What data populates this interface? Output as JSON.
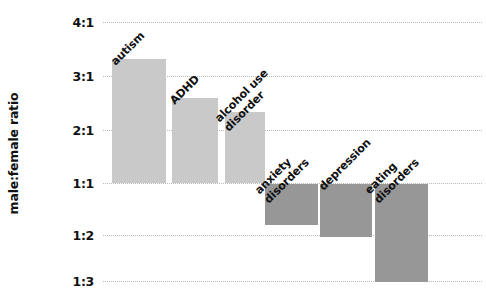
{
  "chart_data": {
    "type": "bar",
    "title": "",
    "subtitle": "",
    "xlabel": "",
    "ylabel": "male:female ratio",
    "categories": [
      "autism",
      "ADHD",
      "alcohol use\ndisorder",
      "anxiety\ndisorders",
      "depression",
      "eating\ndisorders"
    ],
    "values": [
      3.3,
      2.5,
      2.3,
      -1.8,
      -2.0,
      -3.0
    ],
    "value_labels": [
      "3.3:1",
      "2.5:1",
      "2.3:1",
      "1:1.8",
      "1:2",
      "1:3"
    ],
    "ytick_labels": [
      "4:1",
      "3:1",
      "2:1",
      "1:1",
      "1:2",
      "1:3"
    ],
    "ytick_values": [
      4,
      3,
      2,
      1,
      -2,
      -3
    ],
    "ylim": [
      -3.3,
      4.0
    ],
    "grid": true,
    "legend": "none",
    "baseline_label": "1:1",
    "colors": {
      "positive_bar": "#c9c9c9",
      "negative_bar": "#979797",
      "gridline": "#b9b9b9",
      "text": "#111111",
      "background": "#ffffff"
    }
  },
  "axis": {
    "ticks": [
      {
        "label": "4:1",
        "y": 22
      },
      {
        "label": "3:1",
        "y": 76
      },
      {
        "label": "2:1",
        "y": 130
      },
      {
        "label": "1:1",
        "y": 183
      },
      {
        "label": "1:2",
        "y": 235
      },
      {
        "label": "1:3",
        "y": 281
      }
    ]
  },
  "bars": [
    {
      "name": "autism",
      "label": "autism",
      "x": 112,
      "y": 59,
      "w": 54,
      "h": 124,
      "sign": "positive",
      "label_x": 118,
      "label_y": 56
    },
    {
      "name": "adhd",
      "label": "ADHD",
      "x": 172,
      "y": 98,
      "w": 46,
      "h": 85,
      "sign": "positive",
      "label_x": 177,
      "label_y": 95
    },
    {
      "name": "alcohol-use-disorder",
      "label": "alcohol use\ndisorder",
      "x": 225,
      "y": 112,
      "w": 40,
      "h": 71,
      "sign": "positive",
      "label_x": 231,
      "label_y": 109
    },
    {
      "name": "anxiety-disorders",
      "label": "anxiety\ndisorders",
      "x": 265,
      "y": 184,
      "w": 53,
      "h": 41,
      "sign": "negative",
      "label_x": 271,
      "label_y": 181
    },
    {
      "name": "depression",
      "label": "depression",
      "x": 320,
      "y": 184,
      "w": 52,
      "h": 53,
      "sign": "negative",
      "label_x": 326,
      "label_y": 181
    },
    {
      "name": "eating-disorders",
      "label": "eating\ndisorders",
      "x": 375,
      "y": 184,
      "w": 53,
      "h": 98,
      "sign": "negative",
      "label_x": 381,
      "label_y": 181
    }
  ]
}
